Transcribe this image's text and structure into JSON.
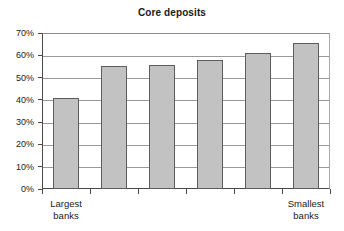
{
  "chart_data": {
    "type": "bar",
    "title": "Core deposits",
    "xlabel": "",
    "ylabel": "",
    "categories": [
      "Largest banks",
      "",
      "",
      "",
      "",
      "Smallest banks"
    ],
    "values": [
      41,
      55,
      55.5,
      58,
      61,
      65.5
    ],
    "value_unit": "%",
    "ylim": [
      0,
      70
    ],
    "ytick_values": [
      0,
      10,
      20,
      30,
      40,
      50,
      60,
      70
    ],
    "ytick_labels": [
      "0%",
      "10%",
      "20%",
      "30%",
      "40%",
      "50%",
      "60%",
      "70%"
    ],
    "grid": true,
    "grid_axis": "y",
    "legend": false,
    "legend_position": "none",
    "bar_fill_color": "#c2c2c2",
    "bar_border_color": "#5d5d5d",
    "axis_color": "#4a4a4a",
    "grid_color": "#9a9a9a",
    "background_color": "#ffffff",
    "text_color": "#1a1a1a",
    "x_category_labels": [
      {
        "line1": "Largest",
        "line2": "banks",
        "index": 0
      },
      {
        "line1": "Smallest",
        "line2": "banks",
        "index": 5
      }
    ]
  }
}
